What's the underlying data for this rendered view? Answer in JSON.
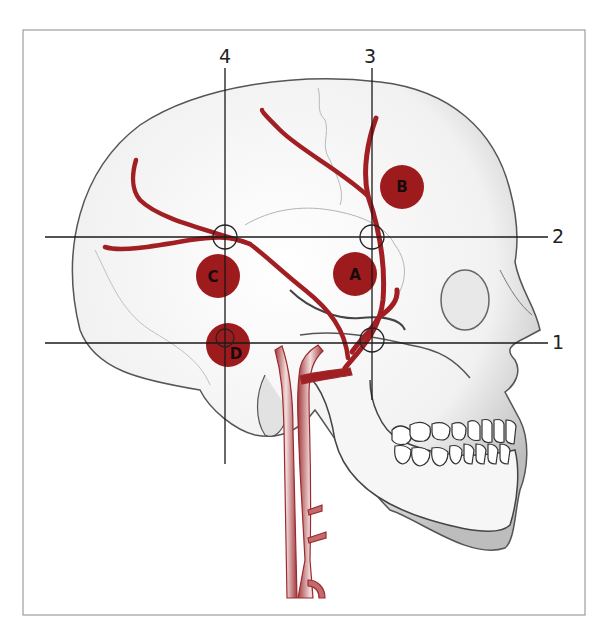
{
  "figure": {
    "colors": {
      "artery": "#a11f22",
      "marker": "#9e1b1d",
      "line": "#1a1a1a",
      "skull_fill": "#f2f2f2",
      "skull_shade": "#cfcfcf",
      "frame": "#8a8a8a",
      "carotid_fill": "#e9c6c6",
      "carotid_edge": "#9a2a2e"
    },
    "reference_lines": [
      {
        "id": "1",
        "label": "1",
        "orientation": "horizontal"
      },
      {
        "id": "2",
        "label": "2",
        "orientation": "horizontal"
      },
      {
        "id": "3",
        "label": "3",
        "orientation": "vertical"
      },
      {
        "id": "4",
        "label": "4",
        "orientation": "vertical"
      }
    ],
    "markers": [
      {
        "id": "A",
        "label": "A"
      },
      {
        "id": "B",
        "label": "B"
      },
      {
        "id": "C",
        "label": "C"
      },
      {
        "id": "D",
        "label": "D"
      }
    ]
  }
}
